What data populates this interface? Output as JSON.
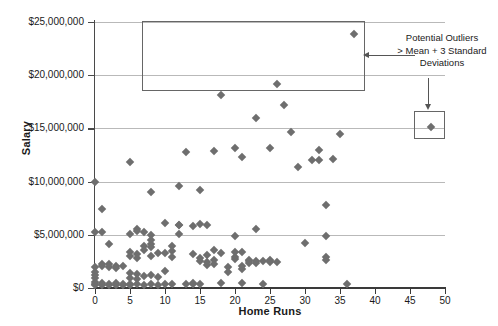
{
  "chart_data": {
    "type": "scatter",
    "title": "",
    "xlabel": "Home Runs",
    "ylabel": "Salary",
    "xlim": [
      0,
      50
    ],
    "ylim": [
      0,
      25000000
    ],
    "grid": true,
    "legend": "none",
    "x_ticks": [
      "0",
      "5",
      "10",
      "15",
      "20",
      "25",
      "30",
      "35",
      "40",
      "45",
      "50"
    ],
    "x_tick_values": [
      0,
      5,
      10,
      15,
      20,
      25,
      30,
      35,
      40,
      45,
      50
    ],
    "y_ticks": [
      "$0",
      "$5,000,000",
      "$10,000,000",
      "$15,000,000",
      "$20,000,000",
      "$25,000,000"
    ],
    "y_tick_values": [
      0,
      5000000,
      10000000,
      15000000,
      20000000,
      25000000
    ],
    "marker": "diamond",
    "marker_color": "#6e6e6e",
    "points": [
      [
        0,
        10000000
      ],
      [
        1,
        7400000
      ],
      [
        0,
        5300000
      ],
      [
        1,
        5250000
      ],
      [
        2,
        4100000
      ],
      [
        0,
        2000000
      ],
      [
        0,
        1500000
      ],
      [
        0,
        1250000
      ],
      [
        0,
        900000
      ],
      [
        0,
        600000
      ],
      [
        0,
        400000
      ],
      [
        0,
        250000
      ],
      [
        1,
        2300000
      ],
      [
        1,
        2050000
      ],
      [
        1,
        500000
      ],
      [
        1,
        300000
      ],
      [
        2,
        2250000
      ],
      [
        2,
        2000000
      ],
      [
        2,
        350000
      ],
      [
        2,
        250000
      ],
      [
        3,
        2100000
      ],
      [
        3,
        1900000
      ],
      [
        3,
        500000
      ],
      [
        3,
        300000
      ],
      [
        4,
        2050000
      ],
      [
        4,
        400000
      ],
      [
        4,
        250000
      ],
      [
        5,
        11800000
      ],
      [
        5,
        5050000
      ],
      [
        5,
        3350000
      ],
      [
        5,
        3050000
      ],
      [
        5,
        1400000
      ],
      [
        5,
        900000
      ],
      [
        5,
        400000
      ],
      [
        5,
        250000
      ],
      [
        6,
        5500000
      ],
      [
        6,
        5350000
      ],
      [
        6,
        3150000
      ],
      [
        6,
        2850000
      ],
      [
        6,
        1350000
      ],
      [
        6,
        800000
      ],
      [
        6,
        350000
      ],
      [
        7,
        5300000
      ],
      [
        7,
        3950000
      ],
      [
        7,
        3600000
      ],
      [
        7,
        1150000
      ],
      [
        7,
        300000
      ],
      [
        8,
        9000000
      ],
      [
        8,
        5000000
      ],
      [
        8,
        4500000
      ],
      [
        8,
        4150000
      ],
      [
        8,
        3850000
      ],
      [
        8,
        3000000
      ],
      [
        8,
        1200000
      ],
      [
        8,
        350000
      ],
      [
        9,
        3250000
      ],
      [
        9,
        1050000
      ],
      [
        9,
        300000
      ],
      [
        10,
        6100000
      ],
      [
        10,
        3300000
      ],
      [
        10,
        1600000
      ],
      [
        10,
        400000
      ],
      [
        11,
        3950000
      ],
      [
        11,
        3500000
      ],
      [
        11,
        2900000
      ],
      [
        11,
        350000
      ],
      [
        12,
        9600000
      ],
      [
        12,
        5950000
      ],
      [
        12,
        5900000
      ],
      [
        12,
        5050000
      ],
      [
        13,
        12750000
      ],
      [
        13,
        400000
      ],
      [
        14,
        5800000
      ],
      [
        14,
        3200000
      ],
      [
        14,
        450000
      ],
      [
        14,
        400000
      ],
      [
        15,
        9200000
      ],
      [
        15,
        6050000
      ],
      [
        15,
        2800000
      ],
      [
        15,
        2550000
      ],
      [
        15,
        400000
      ],
      [
        16,
        5950000
      ],
      [
        16,
        3100000
      ],
      [
        16,
        2450000
      ],
      [
        16,
        2200000
      ],
      [
        17,
        12900000
      ],
      [
        17,
        3600000
      ],
      [
        17,
        2600000
      ],
      [
        17,
        2250000
      ],
      [
        18,
        18100000
      ],
      [
        18,
        3250000
      ],
      [
        18,
        450000
      ],
      [
        19,
        2000000
      ],
      [
        19,
        1550000
      ],
      [
        20,
        13200000
      ],
      [
        20,
        4900000
      ],
      [
        20,
        3400000
      ],
      [
        20,
        2950000
      ],
      [
        20,
        2700000
      ],
      [
        21,
        12300000
      ],
      [
        21,
        3350000
      ],
      [
        21,
        2050000
      ],
      [
        21,
        1750000
      ],
      [
        21,
        450000
      ],
      [
        22,
        2650000
      ],
      [
        22,
        2550000
      ],
      [
        22,
        2350000
      ],
      [
        23,
        16000000
      ],
      [
        23,
        5500000
      ],
      [
        23,
        2500000
      ],
      [
        23,
        2350000
      ],
      [
        24,
        2500000
      ],
      [
        24,
        400000
      ],
      [
        25,
        13200000
      ],
      [
        25,
        2600000
      ],
      [
        25,
        2500000
      ],
      [
        25,
        2450000
      ],
      [
        26,
        19200000
      ],
      [
        26,
        2450000
      ],
      [
        27,
        17200000
      ],
      [
        28,
        14700000
      ],
      [
        29,
        11400000
      ],
      [
        30,
        4200000
      ],
      [
        31,
        12000000
      ],
      [
        32,
        13000000
      ],
      [
        32,
        12000000
      ],
      [
        33,
        7800000
      ],
      [
        33,
        4850000
      ],
      [
        33,
        2950000
      ],
      [
        33,
        2650000
      ],
      [
        34,
        12100000
      ],
      [
        35,
        14500000
      ],
      [
        36,
        400000
      ],
      [
        37,
        23900000
      ],
      [
        48,
        15100000
      ]
    ],
    "annotations": [
      {
        "name": "outlier-callout",
        "text_lines": [
          "Potential Outliers",
          "> Mean  +  3 Standard",
          "Deviations"
        ],
        "targets": [
          "upper-outlier-region",
          "right-outlier-point"
        ]
      }
    ],
    "outlier_regions": [
      {
        "name": "upper-outlier-region",
        "x_range": [
          13.5,
          45
        ],
        "y_range": [
          18600000,
          24200000
        ]
      },
      {
        "name": "right-outlier-point",
        "x_range": [
          46,
          50
        ],
        "y_range": [
          13800000,
          16200000
        ]
      }
    ]
  },
  "annotation": {
    "line1": "Potential Outliers",
    "line2": "> Mean  +  3 Standard",
    "line3": "Deviations"
  }
}
